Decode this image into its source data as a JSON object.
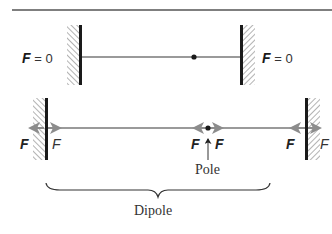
{
  "diagram": {
    "top_panel": {
      "left_label": {
        "symbol": "F",
        "text": " = 0"
      },
      "right_label": {
        "symbol": "F",
        "text": " = 0"
      },
      "description": "Rod fixed between two walls with a pole dot; no net force"
    },
    "bottom_panel": {
      "force_labels": {
        "left_wall_outer": "F",
        "left_wall_inner": "F",
        "pole_left": "F",
        "pole_right": "F",
        "right_wall_inner": "F",
        "right_wall_outer": "F"
      },
      "pole_label": "Pole",
      "brace_label": "Dipole"
    },
    "colors": {
      "rod": "#9a9a9a",
      "wall": "#1a1a1a",
      "hatch": "#8a8a8a",
      "arrow": "#8c8c8c",
      "text": "#222222",
      "rule": "#555555"
    }
  }
}
